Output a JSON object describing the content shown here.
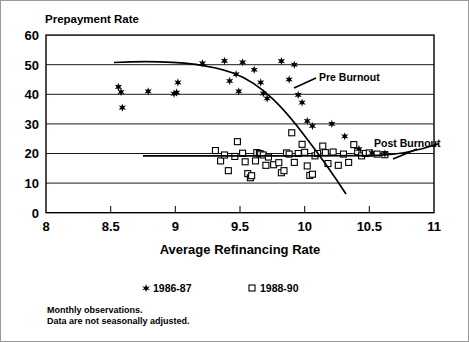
{
  "chart_data": {
    "type": "scatter",
    "title": "",
    "ylabel": "Prepayment Rate",
    "xlabel": "Average Refinancing Rate",
    "xlim": [
      8,
      11
    ],
    "ylim": [
      0,
      60
    ],
    "xticks": [
      8,
      8.5,
      9,
      9.5,
      10,
      10.5,
      11
    ],
    "xtick_labels": [
      "8",
      "8.5",
      "9",
      "9.5",
      "10",
      "10.5",
      "11"
    ],
    "yticks": [
      0,
      10,
      20,
      30,
      40,
      50,
      60
    ],
    "ytick_labels": [
      "0",
      "10",
      "20",
      "30",
      "40",
      "50",
      "60"
    ],
    "grid": true,
    "legend_position": "below-axis",
    "series": [
      {
        "name": "1986-87",
        "marker": "star",
        "points": [
          [
            8.56,
            42.5
          ],
          [
            8.58,
            40.8
          ],
          [
            8.59,
            35.5
          ],
          [
            8.79,
            41.0
          ],
          [
            8.99,
            40.2
          ],
          [
            9.01,
            40.6
          ],
          [
            9.02,
            44.0
          ],
          [
            9.21,
            50.5
          ],
          [
            9.38,
            51.3
          ],
          [
            9.42,
            44.5
          ],
          [
            9.47,
            46.8
          ],
          [
            9.49,
            41.0
          ],
          [
            9.52,
            50.8
          ],
          [
            9.61,
            48.3
          ],
          [
            9.66,
            44.0
          ],
          [
            9.68,
            40.3
          ],
          [
            9.71,
            38.6
          ],
          [
            9.82,
            51.2
          ],
          [
            9.88,
            45.0
          ],
          [
            9.92,
            50.0
          ],
          [
            9.95,
            39.8
          ],
          [
            9.98,
            37.2
          ],
          [
            10.02,
            31.0
          ],
          [
            10.06,
            29.3
          ],
          [
            10.21,
            30.0
          ],
          [
            10.31,
            25.8
          ],
          [
            10.42,
            21.5
          ],
          [
            10.52,
            20.2
          ],
          [
            10.62,
            20.0
          ]
        ]
      },
      {
        "name": "1988-90",
        "marker": "square",
        "points": [
          [
            9.31,
            21.0
          ],
          [
            9.35,
            17.5
          ],
          [
            9.38,
            19.5
          ],
          [
            9.41,
            14.2
          ],
          [
            9.46,
            19.0
          ],
          [
            9.48,
            24.0
          ],
          [
            9.52,
            20.1
          ],
          [
            9.54,
            17.2
          ],
          [
            9.56,
            13.2
          ],
          [
            9.58,
            11.8
          ],
          [
            9.59,
            12.5
          ],
          [
            9.62,
            17.5
          ],
          [
            9.63,
            20.3
          ],
          [
            9.65,
            20.0
          ],
          [
            9.66,
            19.8
          ],
          [
            9.68,
            19.5
          ],
          [
            9.7,
            16.0
          ],
          [
            9.72,
            18.8
          ],
          [
            9.76,
            16.2
          ],
          [
            9.8,
            16.9
          ],
          [
            9.82,
            13.5
          ],
          [
            9.84,
            14.2
          ],
          [
            9.86,
            20.2
          ],
          [
            9.88,
            19.8
          ],
          [
            9.9,
            27.0
          ],
          [
            9.92,
            17.0
          ],
          [
            9.95,
            20.0
          ],
          [
            9.98,
            23.1
          ],
          [
            10.0,
            20.4
          ],
          [
            10.02,
            15.8
          ],
          [
            10.04,
            12.6
          ],
          [
            10.06,
            13.0
          ],
          [
            10.08,
            19.2
          ],
          [
            10.1,
            20.0
          ],
          [
            10.14,
            22.5
          ],
          [
            10.16,
            20.3
          ],
          [
            10.18,
            16.6
          ],
          [
            10.22,
            20.5
          ],
          [
            10.26,
            16.0
          ],
          [
            10.3,
            19.8
          ],
          [
            10.34,
            17.0
          ],
          [
            10.38,
            23.0
          ],
          [
            10.41,
            20.6
          ],
          [
            10.44,
            19.2
          ],
          [
            10.47,
            20.0
          ],
          [
            10.5,
            20.2
          ],
          [
            10.56,
            19.8
          ],
          [
            10.62,
            19.6
          ]
        ]
      }
    ],
    "trend_curves": [
      {
        "name": "Pre Burnout",
        "label": "Pre Burnout",
        "description": "Declining S-curve from upper left through the 1986-87 stars",
        "x_start": 8.53,
        "x_end": 10.72,
        "y_start": 47.0,
        "y_end": 6.5
      },
      {
        "name": "Post Burnout",
        "label": "Post Burnout",
        "description": "Near-flat line at about 19 rising slightly at the right end",
        "x_start": 9.28,
        "x_end": 10.88,
        "y_start": 19.4,
        "y_end": 23.0
      }
    ],
    "annotations": [
      {
        "text": "Pre Burnout"
      },
      {
        "text": "Post Burnout"
      }
    ],
    "footnotes": [
      "Monthly observations.",
      "Data are not seasonally adjusted."
    ]
  },
  "legend": {
    "items": [
      {
        "label": "1986-87",
        "marker": "star"
      },
      {
        "label": "1988-90",
        "marker": "square"
      }
    ]
  }
}
